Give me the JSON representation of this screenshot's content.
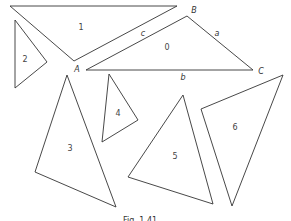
{
  "figure": {
    "caption": "Fig. 1.41",
    "triangles": [
      {
        "id": "0",
        "label": "0"
      },
      {
        "id": "1",
        "label": "1"
      },
      {
        "id": "2",
        "label": "2"
      },
      {
        "id": "3",
        "label": "3"
      },
      {
        "id": "4",
        "label": "4"
      },
      {
        "id": "5",
        "label": "5"
      },
      {
        "id": "6",
        "label": "6"
      }
    ],
    "vertex_labels": {
      "A": "A",
      "B": "B",
      "C": "C"
    },
    "side_labels": {
      "a": "a",
      "b": "b",
      "c": "c"
    }
  },
  "colors": {
    "stroke": "#333333",
    "background": "#ffffff"
  }
}
